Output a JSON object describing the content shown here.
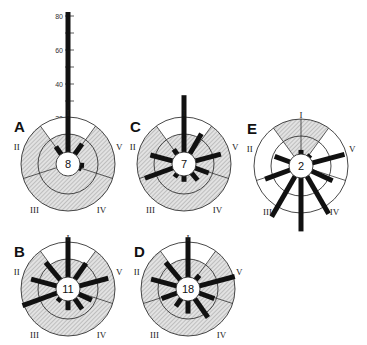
{
  "colors": {
    "ink": "#111111",
    "shade": "#cfcfcf",
    "line": "#333333",
    "background": "#ffffff"
  },
  "scale": {
    "ticks": [
      {
        "value": 80,
        "label": "80"
      },
      {
        "value": 70,
        "label": ""
      },
      {
        "value": 60,
        "label": "60"
      },
      {
        "value": 50,
        "label": ""
      },
      {
        "value": 40,
        "label": "40"
      },
      {
        "value": 30,
        "label": ""
      },
      {
        "value": 20,
        "label": "20"
      }
    ]
  },
  "sector_labels": [
    "I",
    "II",
    "III",
    "IV",
    "V"
  ],
  "panels": [
    {
      "letter": "A",
      "center_value": "8",
      "cx": 68,
      "cy": 164,
      "shading": "ring-with-clear-top",
      "bars": [
        {
          "angle": 0,
          "len": 83
        },
        {
          "angle": -35,
          "len": 6
        },
        {
          "angle": 35,
          "len": 8
        },
        {
          "angle": 95,
          "len": 3
        },
        {
          "angle": 110,
          "len": 2
        }
      ]
    },
    {
      "letter": "C",
      "center_value": "7",
      "cx": 184,
      "cy": 164,
      "shading": "ring-with-clear-top",
      "bars": [
        {
          "angle": 0,
          "len": 34
        },
        {
          "angle": 30,
          "len": 14
        },
        {
          "angle": 75,
          "len": 16
        },
        {
          "angle": 110,
          "len": 9
        },
        {
          "angle": 140,
          "len": 6
        },
        {
          "angle": 180,
          "len": 4
        },
        {
          "angle": 215,
          "len": 3
        },
        {
          "angle": 250,
          "len": 18
        },
        {
          "angle": 285,
          "len": 14
        },
        {
          "angle": 325,
          "len": 4
        }
      ]
    },
    {
      "letter": "E",
      "center_value": "2",
      "cx": 301,
      "cy": 166,
      "shading": "top-wedge",
      "bars": [
        {
          "angle": 0,
          "len": 3
        },
        {
          "angle": 40,
          "len": 2
        },
        {
          "angle": 75,
          "len": 20
        },
        {
          "angle": 115,
          "len": 14
        },
        {
          "angle": 150,
          "len": 26
        },
        {
          "angle": 180,
          "len": 32
        },
        {
          "angle": 210,
          "len": 28
        },
        {
          "angle": 250,
          "len": 16
        },
        {
          "angle": 290,
          "len": 10
        }
      ]
    },
    {
      "letter": "B",
      "center_value": "11",
      "cx": 68,
      "cy": 289,
      "shading": "ring-with-clear-top",
      "bars": [
        {
          "angle": 0,
          "len": 24
        },
        {
          "angle": 35,
          "len": 12
        },
        {
          "angle": 75,
          "len": 18
        },
        {
          "angle": 115,
          "len": 9
        },
        {
          "angle": 145,
          "len": 8
        },
        {
          "angle": 180,
          "len": 6
        },
        {
          "angle": 220,
          "len": 3
        },
        {
          "angle": 250,
          "len": 22
        },
        {
          "angle": 285,
          "len": 16
        },
        {
          "angle": 320,
          "len": 14
        }
      ]
    },
    {
      "letter": "D",
      "center_value": "18",
      "cx": 188,
      "cy": 289,
      "shading": "ring-with-clear-top",
      "bars": [
        {
          "angle": 0,
          "len": 24
        },
        {
          "angle": 40,
          "len": 4
        },
        {
          "angle": 75,
          "len": 22
        },
        {
          "angle": 110,
          "len": 10
        },
        {
          "angle": 145,
          "len": 14
        },
        {
          "angle": 180,
          "len": 8
        },
        {
          "angle": 215,
          "len": 6
        },
        {
          "angle": 250,
          "len": 10
        },
        {
          "angle": 285,
          "len": 16
        },
        {
          "angle": 320,
          "len": 14
        }
      ]
    }
  ]
}
